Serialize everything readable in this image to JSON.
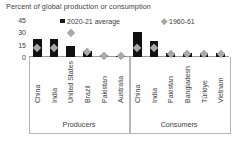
{
  "chart_title": "Percent of global production or consumption",
  "legend": [
    {
      "label": "2020-21 average",
      "marker": "square",
      "color": "#111111"
    },
    {
      "label": "1960-61",
      "marker": "diamond",
      "color": "#a9a9a9"
    }
  ],
  "groups": [
    {
      "name": "Producers"
    },
    {
      "name": "Consumers"
    }
  ],
  "chart_data": {
    "type": "bar",
    "title": "Percent of global production or consumption",
    "xlabel": "",
    "ylabel": "Percent of global production or consumption",
    "ylim": [
      0,
      45
    ],
    "yticks": [
      0,
      15,
      30,
      45
    ],
    "grid": false,
    "legend_position": "top",
    "categories": [
      "China",
      "India",
      "United States",
      "Brazil",
      "Pakistan",
      "Australia",
      "China",
      "India",
      "Pakistan",
      "Bangladesh",
      "Türkiye",
      "Vietnam"
    ],
    "groups": [
      "Producers",
      "Producers",
      "Producers",
      "Producers",
      "Producers",
      "Producers",
      "Consumers",
      "Consumers",
      "Consumers",
      "Consumers",
      "Consumers",
      "Consumers"
    ],
    "series": [
      {
        "name": "2020-21 average",
        "marker": "bar",
        "color": "#111111",
        "values": [
          22,
          22,
          14,
          7,
          2,
          1.5,
          31,
          20,
          5,
          5,
          4.5,
          5
        ]
      },
      {
        "name": "1960-61",
        "marker": "diamond",
        "color": "#a9a9a9",
        "values": [
          11,
          11,
          30,
          6,
          2,
          1.5,
          11,
          11,
          4,
          4,
          4,
          4
        ]
      }
    ]
  }
}
